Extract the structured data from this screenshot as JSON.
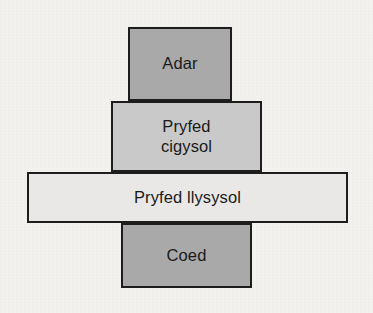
{
  "diagram": {
    "type": "food-chain-pyramid",
    "language": "cy",
    "background_color": "#f4f2ef",
    "border_color": "#1d1d1d",
    "levels": [
      {
        "id": "adar",
        "label": "Adar",
        "tier": 4,
        "fill_color": "#a9a9a9"
      },
      {
        "id": "pryfed-cigysol",
        "label": "Pryfed\ncigysol",
        "tier": 3,
        "fill_color": "#c9c9c9"
      },
      {
        "id": "pryfed-llysysol",
        "label": "Pryfed llysysol",
        "tier": 2,
        "fill_color": "#e9e8e6"
      },
      {
        "id": "coed",
        "label": "Coed",
        "tier": 1,
        "fill_color": "#a9a9a9"
      }
    ]
  }
}
